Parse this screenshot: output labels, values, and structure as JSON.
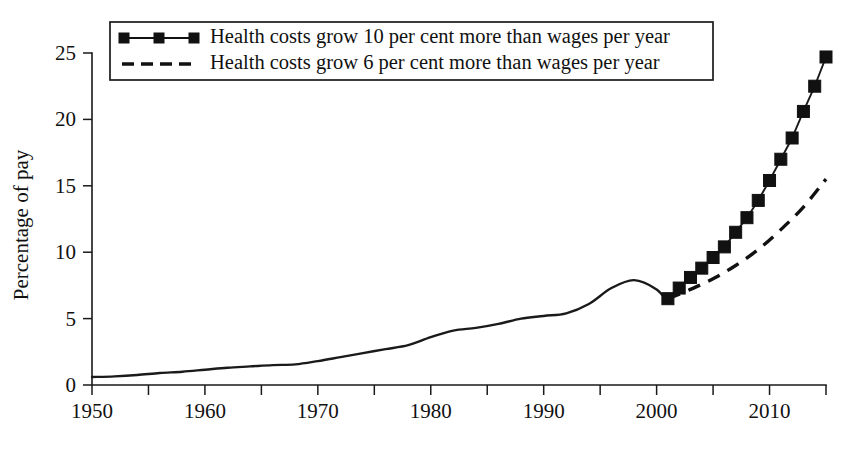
{
  "chart_data": {
    "type": "line",
    "title": "",
    "subtitle": "",
    "xlabel": "",
    "ylabel": "Percentage of pay",
    "xlim": [
      1950,
      2015
    ],
    "ylim": [
      0,
      25
    ],
    "grid": false,
    "legend_position": "top-left",
    "x_ticks": [
      1950,
      1960,
      1970,
      1980,
      1990,
      2000,
      2010
    ],
    "x_tick_labels": [
      "1950",
      "1960",
      "1970",
      "1980",
      "1990",
      "2000",
      "2010"
    ],
    "x_minor_ticks": [
      1955,
      1965,
      1975,
      1985,
      1995,
      2005,
      2015
    ],
    "y_ticks": [
      0,
      5,
      10,
      15,
      20,
      25
    ],
    "y_tick_labels": [
      "0",
      "5",
      "10",
      "15",
      "20",
      "25"
    ],
    "series": [
      {
        "name": "Historical",
        "style": "solid",
        "marker": "none",
        "in_legend": false,
        "x": [
          1950,
          1952,
          1954,
          1956,
          1958,
          1960,
          1962,
          1964,
          1966,
          1968,
          1970,
          1972,
          1974,
          1976,
          1978,
          1980,
          1982,
          1984,
          1986,
          1988,
          1990,
          1992,
          1994,
          1996,
          1998,
          2000,
          2001
        ],
        "values": [
          0.6,
          0.65,
          0.75,
          0.9,
          1.0,
          1.15,
          1.3,
          1.4,
          1.5,
          1.55,
          1.8,
          2.1,
          2.4,
          2.7,
          3.0,
          3.6,
          4.1,
          4.3,
          4.6,
          5.0,
          5.2,
          5.4,
          6.1,
          7.3,
          7.9,
          7.2,
          6.2
        ]
      },
      {
        "name": "Health costs grow 10 per cent more than wages per year",
        "style": "solid-marker",
        "marker": "square",
        "in_legend": true,
        "x": [
          2001,
          2002,
          2003,
          2004,
          2005,
          2006,
          2007,
          2008,
          2009,
          2010,
          2011,
          2012,
          2013,
          2014,
          2015
        ],
        "values": [
          6.5,
          7.3,
          8.1,
          8.8,
          9.6,
          10.4,
          11.5,
          12.6,
          13.9,
          15.4,
          17.0,
          18.6,
          20.6,
          22.5,
          24.7
        ]
      },
      {
        "name": "Health costs grow 6 per cent more than wages per year",
        "style": "dashed",
        "marker": "none",
        "in_legend": true,
        "x": [
          2001,
          2003,
          2005,
          2007,
          2009,
          2011,
          2013,
          2015
        ],
        "values": [
          6.5,
          7.2,
          8.0,
          9.0,
          10.2,
          11.7,
          13.4,
          15.5
        ]
      }
    ],
    "legend_entries": [
      {
        "label": "Health costs grow 10 per cent more than wages per year",
        "style": "solid-marker"
      },
      {
        "label": "Health costs grow 6 per cent more than wages per year",
        "style": "dashed"
      }
    ],
    "colors": {
      "line": "#111111",
      "axis": "#1a1a1a",
      "background": "#ffffff"
    }
  }
}
